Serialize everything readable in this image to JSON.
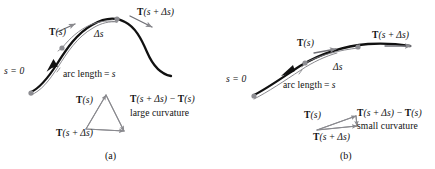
{
  "figure": {
    "title_text": "",
    "background_color": "#ffffff",
    "curve_color": "#111111",
    "accent_gray": "#8a8a8f",
    "panels": [
      {
        "id": "a",
        "caption": "(a)",
        "curvature_note": "large curvature",
        "labels": {
          "s_zero": "s = 0",
          "arc_length": "arc length = s",
          "delta_s": "Δs",
          "tangent_s": "T(s)",
          "tangent_s_plus": "T(s + Δs)",
          "difference": "T(s + Δs) − T(s)",
          "triangle_tangent_s": "T(s)",
          "triangle_tangent_s_plus": "T(s + Δs)"
        }
      },
      {
        "id": "b",
        "caption": "(b)",
        "curvature_note": "small curvature",
        "labels": {
          "s_zero": "s = 0",
          "arc_length": "arc length = s",
          "delta_s": "Δs",
          "tangent_s": "T(s)",
          "tangent_s_plus": "T(s + Δs)",
          "difference": "T(s + Δs) − T(s)",
          "triangle_tangent_s": "T(s)",
          "triangle_tangent_s_plus": "T(s + Δs)"
        }
      }
    ]
  }
}
